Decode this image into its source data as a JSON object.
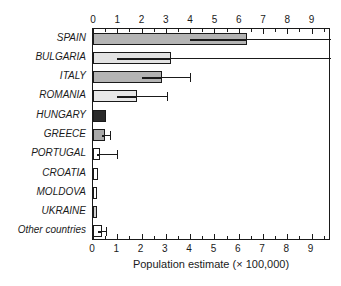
{
  "chart_data": {
    "type": "bar",
    "orientation": "horizontal",
    "title": "",
    "xlabel": "Population estimate (× 100,000)",
    "ylabel": "",
    "xlim": [
      0,
      9.8
    ],
    "grid": false,
    "legend": "none",
    "x_ticks_major": [
      0,
      1,
      2,
      3,
      4,
      5,
      6,
      7,
      8,
      9
    ],
    "x_tick_labels": [
      "0",
      "1",
      "2",
      "3",
      "4",
      "5",
      "6",
      "7",
      "8",
      "9"
    ],
    "x_ticks_minor_step": 0.5,
    "axis_top": true,
    "axis_bottom": true,
    "categories": [
      "SPAIN",
      "BULGARIA",
      "ITALY",
      "ROMANIA",
      "HUNGARY",
      "GREECE",
      "PORTUGAL",
      "CROATIA",
      "MOLDOVA",
      "UKRAINE",
      "Other countries"
    ],
    "values": [
      6.35,
      3.2,
      2.85,
      1.8,
      0.55,
      0.5,
      0.3,
      0.2,
      0.18,
      0.17,
      0.35
    ],
    "error_low": [
      4.0,
      1.0,
      2.0,
      1.0,
      null,
      0.35,
      0.15,
      null,
      null,
      null,
      0.2
    ],
    "error_high": [
      9.8,
      9.8,
      4.0,
      3.05,
      null,
      0.7,
      1.0,
      null,
      null,
      null,
      0.55
    ],
    "bar_colors": [
      "#b4b4b4",
      "#e3e3e3",
      "#b4b4b4",
      "#e8e8e8",
      "#2a2a2a",
      "#a8a8a8",
      "#ffffff",
      "#ffffff",
      "#ffffff",
      "#d0d0d0",
      "#ffffff"
    ],
    "bar_edge_color": "#1a1a1a",
    "error_bar_color": "#1a1a1a",
    "background_color": "#ffffff"
  }
}
